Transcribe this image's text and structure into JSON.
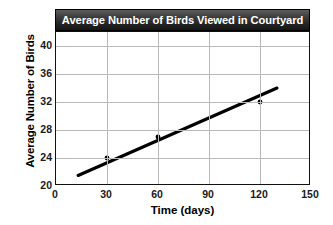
{
  "chart_data": {
    "type": "scatter",
    "title": "Average Number of Birds Viewed in Courtyard",
    "xlabel": "Time (days)",
    "ylabel": "Average Number of Birds",
    "xlim": [
      0,
      150
    ],
    "ylim": [
      20,
      42
    ],
    "xticks": [
      0,
      30,
      60,
      90,
      120,
      150
    ],
    "xtick_labels": [
      "0",
      "30",
      "60",
      "90",
      "120",
      "150"
    ],
    "yticks": [
      20,
      24,
      28,
      32,
      36,
      40
    ],
    "ytick_labels": [
      "20",
      "24",
      "28",
      "32",
      "36",
      "40"
    ],
    "grid": true,
    "grid_x_values": [
      30,
      60,
      90,
      120
    ],
    "grid_y_values": [
      24,
      28,
      32,
      36,
      40
    ],
    "legend": null,
    "points": [
      {
        "x": 30,
        "y": 24
      },
      {
        "x": 60,
        "y": 27
      },
      {
        "x": 120,
        "y": 32
      }
    ],
    "trend_line": {
      "name": "line of best fit",
      "x": [
        13,
        130
      ],
      "y": [
        21.5,
        34.0
      ],
      "color": "#000000"
    }
  }
}
